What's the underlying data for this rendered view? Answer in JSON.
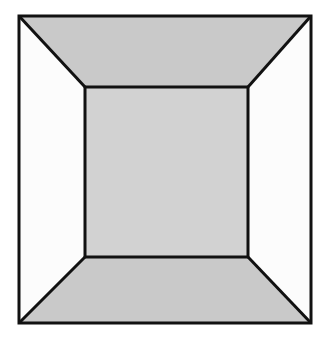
{
  "figure": {
    "canvas": {
      "width": 330,
      "height": 348,
      "background": "#ffffff"
    },
    "stroke": {
      "color": "#111111",
      "width": 3,
      "join": "miter"
    },
    "outer_square": {
      "label": "outer-square",
      "left": 19,
      "top": 16,
      "right": 311,
      "bottom": 323,
      "points": "19,16 311,16 311,323 19,323"
    },
    "inner_square": {
      "label": "inner-square",
      "left": 85,
      "top": 87,
      "right": 248,
      "bottom": 257,
      "points": "85,87 248,87 248,257 85,257",
      "fill": "#d2d2d2"
    },
    "faces": [
      {
        "name": "ceiling",
        "label": "Top trapezoid (ceiling)",
        "points": "19,16 311,16 248,87 85,87",
        "fill": "#c9c9c9"
      },
      {
        "name": "right-wall",
        "label": "Right trapezoid (wall)",
        "points": "311,16 311,323 248,257 248,87",
        "fill": "#fcfcfc"
      },
      {
        "name": "floor",
        "label": "Bottom trapezoid (floor)",
        "points": "19,323 85,257 248,257 311,323",
        "fill": "#c9c9c9"
      },
      {
        "name": "left-wall",
        "label": "Left trapezoid (wall)",
        "points": "19,16 85,87 85,257 19,323",
        "fill": "#fcfcfc"
      }
    ],
    "diagonals": [
      {
        "name": "diagonal-top-left",
        "x1": 19,
        "y1": 16,
        "x2": 85,
        "y2": 87
      },
      {
        "name": "diagonal-top-right",
        "x1": 311,
        "y1": 16,
        "x2": 248,
        "y2": 87
      },
      {
        "name": "diagonal-bottom-right",
        "x1": 311,
        "y1": 323,
        "x2": 248,
        "y2": 257
      },
      {
        "name": "diagonal-bottom-left",
        "x1": 19,
        "y1": 323,
        "x2": 85,
        "y2": 257
      }
    ],
    "colors": {
      "line": "#111111",
      "ceiling_floor_gray": "#c9c9c9",
      "wall_white": "#fcfcfc",
      "back_wall_gray": "#d2d2d2",
      "background": "#ffffff"
    }
  }
}
